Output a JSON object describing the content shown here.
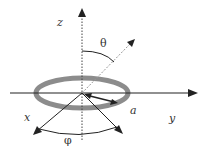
{
  "diagram": {
    "labels": {
      "z": "z",
      "theta": "θ",
      "a": "a",
      "y": "y",
      "x": "x",
      "phi": "φ"
    },
    "colors": {
      "axis": "#222222",
      "ring": "#8c8c8c",
      "dotted": "#444444",
      "dashed": "#999999",
      "label": "#333333",
      "background": "#ffffff"
    },
    "elements": [
      "z-axis (vertical, dotted below arrow)",
      "y-axis (horizontal)",
      "x-axis (diagonal toward front-left)",
      "radial vector at angle phi",
      "ring of radius a",
      "position vector at angle theta from z",
      "theta arc",
      "phi arc"
    ]
  }
}
